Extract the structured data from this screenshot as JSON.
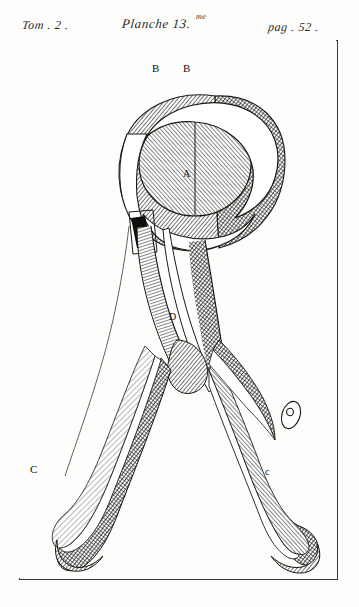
{
  "header": {
    "volume": "Tom . 2 .",
    "plate": "Planche 13.",
    "plate_superscript": "me",
    "page": "pag . 52 ."
  },
  "plate": {
    "figure_title": "obstetric-forceps-engraving",
    "labels": {
      "b_left": "B",
      "b_right": "B",
      "a_center": "A",
      "d_shank": "D",
      "c_left_handle": "C",
      "c_right_handle": "c"
    }
  },
  "colors": {
    "paper": "#fdfdfc",
    "ink": "#2b2b28",
    "border": "#3a3a38",
    "hatch_dark": "#1d1d1b",
    "hatch_mid": "#4a4a46",
    "highlight": "#ffffff"
  }
}
